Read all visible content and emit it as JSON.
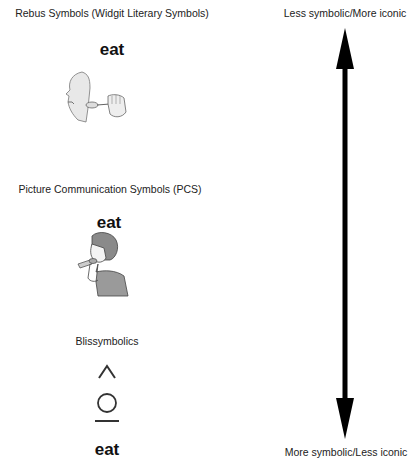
{
  "sections": [
    {
      "title": "Rebus Symbols (Widgit Literary Symbols)",
      "word": "eat",
      "icon": "face-with-spoon-icon"
    },
    {
      "title": "Picture Communication Symbols (PCS)",
      "word": "eat",
      "icon": "boy-eating-icon"
    },
    {
      "title": "Blissymbolics",
      "word": "eat",
      "icon": "bliss-eat-icon"
    }
  ],
  "scale": {
    "top_label": "Less symbolic/More iconic",
    "bottom_label": "More symbolic/Less iconic",
    "arrow_color": "#000000"
  }
}
